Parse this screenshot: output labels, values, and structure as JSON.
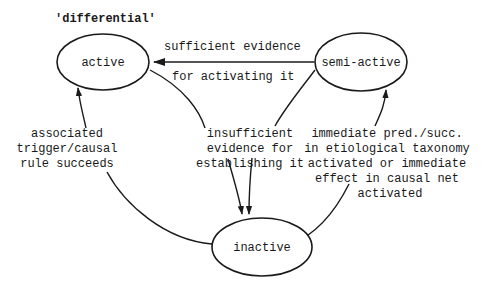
{
  "diagram": {
    "title": "'differential'",
    "nodes": {
      "active": {
        "label": "active"
      },
      "semi_active": {
        "label": "semi-active"
      },
      "inactive": {
        "label": "inactive"
      }
    },
    "edges": {
      "semi_to_active": {
        "from": "semi-active",
        "to": "active",
        "label_lines": [
          "sufficient evidence",
          "for activating it"
        ]
      },
      "to_inactive": {
        "from": [
          "active",
          "semi-active"
        ],
        "to": "inactive",
        "label_lines": [
          "insufficient",
          "evidence for",
          "establishing it"
        ]
      },
      "inactive_to_active": {
        "from": "inactive",
        "to": "active",
        "label_lines": [
          "associated",
          "trigger/causal",
          "rule succeeds"
        ]
      },
      "inactive_to_semi": {
        "from": "inactive",
        "to": "semi-active",
        "label_lines": [
          "immediate pred./succ.",
          "in etiological taxonomy",
          "activated or immediate",
          "effect in causal net",
          "activated"
        ]
      }
    },
    "colors": {
      "stroke": "#1a1a1a",
      "background": "#ffffff"
    }
  }
}
